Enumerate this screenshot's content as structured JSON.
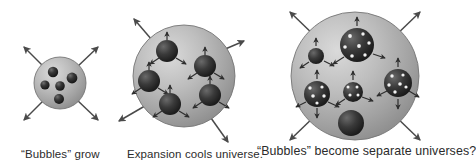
{
  "figure": {
    "background_color": "#ffffff",
    "width": 442,
    "height": 163
  },
  "colors": {
    "sphere_light": "#d0d0d0",
    "sphere_mid": "#a8a8a8",
    "sphere_dark": "#8c8c8c",
    "sphere_outline": "#6e6e6e",
    "inner_sphere_light": "#5a5a5a",
    "inner_sphere_dark": "#1c1c1c",
    "arrow": "#4a4a4a",
    "galaxy_dot": "#f2f2f2",
    "caption_text": "#2b2b2b"
  },
  "panels": [
    {
      "id": "panel-1",
      "caption": "“Bubbles” grow",
      "sphere": {
        "cx": 60,
        "cy": 83,
        "r": 26
      },
      "outer_arrows": [
        {
          "x1": 45,
          "y1": 68,
          "x2": 23,
          "y2": 46
        },
        {
          "x1": 76,
          "y1": 68,
          "x2": 99,
          "y2": 46
        },
        {
          "x1": 45,
          "y1": 99,
          "x2": 23,
          "y2": 121
        },
        {
          "x1": 76,
          "y1": 99,
          "x2": 99,
          "y2": 121
        }
      ],
      "inner_spheres": [
        {
          "cx": 53,
          "cy": 72,
          "r": 5.2
        },
        {
          "cx": 72,
          "cy": 78,
          "r": 5.4
        },
        {
          "cx": 45,
          "cy": 85,
          "r": 4.6
        },
        {
          "cx": 60,
          "cy": 86,
          "r": 4.8
        },
        {
          "cx": 59,
          "cy": 99,
          "r": 5.0
        }
      ],
      "inner_sphere_count": 5,
      "has_inner_arrows": false,
      "has_galaxy_dots": false
    },
    {
      "id": "panel-2",
      "caption": "Expansion cools universe.",
      "sphere": {
        "cx": 184,
        "cy": 76,
        "r": 51
      },
      "outer_arrows": [
        {
          "x1": 156,
          "y1": 45,
          "x2": 133,
          "y2": 18
        },
        {
          "x1": 216,
          "y1": 52,
          "x2": 245,
          "y2": 40
        },
        {
          "x1": 150,
          "y1": 104,
          "x2": 118,
          "y2": 122
        },
        {
          "x1": 207,
          "y1": 112,
          "x2": 229,
          "y2": 143
        }
      ],
      "inner_spheres": [
        {
          "cx": 167,
          "cy": 51,
          "r": 11
        },
        {
          "cx": 205,
          "cy": 66,
          "r": 11
        },
        {
          "cx": 149,
          "cy": 81,
          "r": 11
        },
        {
          "cx": 210,
          "cy": 95,
          "r": 11
        },
        {
          "cx": 170,
          "cy": 104,
          "r": 11
        }
      ],
      "inner_sphere_count": 5,
      "has_inner_arrows": true,
      "has_galaxy_dots": false
    },
    {
      "id": "panel-3",
      "caption": "“Bubbles” become separate universes?",
      "sphere": {
        "cx": 355,
        "cy": 76,
        "r": 64
      },
      "outer_arrows": [
        {
          "x1": 316,
          "y1": 37,
          "x2": 289,
          "y2": 11
        },
        {
          "x1": 394,
          "y1": 37,
          "x2": 421,
          "y2": 11
        },
        {
          "x1": 316,
          "y1": 115,
          "x2": 289,
          "y2": 141
        },
        {
          "x1": 394,
          "y1": 115,
          "x2": 421,
          "y2": 141
        }
      ],
      "inner_spheres": [
        {
          "cx": 357,
          "cy": 45,
          "r": 17,
          "galaxies": 7
        },
        {
          "cx": 316,
          "cy": 56,
          "r": 8,
          "galaxies": 0
        },
        {
          "cx": 398,
          "cy": 83,
          "r": 14,
          "galaxies": 6
        },
        {
          "cx": 317,
          "cy": 94,
          "r": 13,
          "galaxies": 5
        },
        {
          "cx": 353,
          "cy": 92,
          "r": 10,
          "galaxies": 4
        },
        {
          "cx": 351,
          "cy": 123,
          "r": 13,
          "galaxies": 0
        }
      ],
      "inner_sphere_count": 6,
      "has_inner_arrows": true,
      "has_galaxy_dots": true
    }
  ]
}
